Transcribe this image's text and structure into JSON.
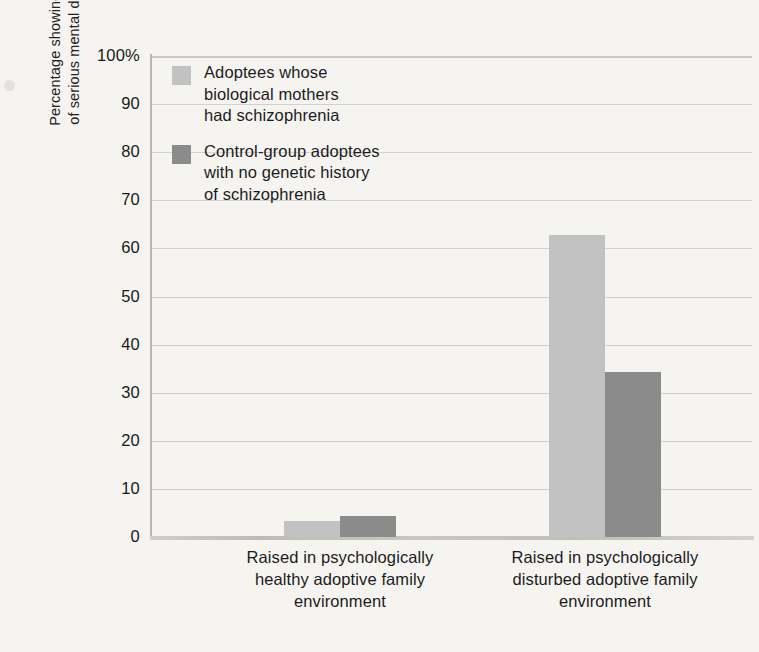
{
  "chart_data": {
    "type": "bar",
    "title": "",
    "xlabel": "",
    "ylabel": "Percentage showing signs of serious mental disorder",
    "ylabel_line1": "Percentage showing signs",
    "ylabel_line2": "of serious mental disorder",
    "ylim": [
      0,
      100
    ],
    "ytick_values": [
      0,
      10,
      20,
      30,
      40,
      50,
      60,
      70,
      80,
      90,
      100
    ],
    "ytick_labels": [
      "0",
      "10",
      "20",
      "30",
      "40",
      "50",
      "60",
      "70",
      "80",
      "90",
      "100%"
    ],
    "grid": true,
    "legend_position": "inside top-left",
    "categories": [
      "Raised in psychologically healthy adoptive family environment",
      "Raised in psychologically disturbed adoptive family environment"
    ],
    "category_lines": [
      [
        "Raised in psychologically",
        "healthy adoptive family",
        "environment"
      ],
      [
        "Raised in psychologically",
        "disturbed adoptive family",
        "environment"
      ]
    ],
    "series": [
      {
        "name": "Adoptees whose biological mothers had schizophrenia",
        "name_lines": [
          "Adoptees whose",
          "biological mothers",
          "had schizophrenia"
        ],
        "color": "#c2c2c2",
        "values": [
          3.3,
          62.8
        ]
      },
      {
        "name": "Control-group adoptees with no genetic history of schizophrenia",
        "name_lines": [
          "Control-group adoptees",
          "with no genetic history",
          "of schizophrenia"
        ],
        "color": "#8b8b8b",
        "values": [
          4.4,
          34.3
        ]
      }
    ]
  },
  "colors": {
    "page_background": "#f6f4f1",
    "series_light": "#c2c2c2",
    "series_dark": "#8b8b8b",
    "gridline": "#d3d1cd",
    "axis": "#b9b7b4",
    "text": "#1c1c1c"
  }
}
